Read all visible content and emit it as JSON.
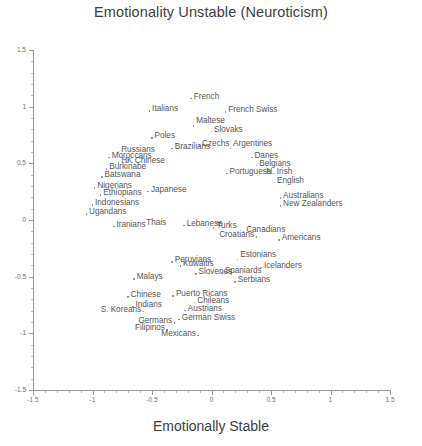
{
  "chart_data": {
    "type": "scatter",
    "title": "Emotionality Unstable (Neuroticism)",
    "xlabel": "Emotionally Stable",
    "ylabel": "",
    "xlim": [
      -1.5,
      1.5
    ],
    "ylim": [
      -1.5,
      1.5
    ],
    "xticks": [
      "-1.5",
      "-1",
      "-0.5",
      "0",
      "0.5",
      "1",
      "1.5"
    ],
    "xtick_values": [
      -1.5,
      -1,
      -0.5,
      0,
      0.5,
      1,
      1.5
    ],
    "yticks": [
      "1.5",
      "1",
      "0.5",
      "0",
      "-0.5",
      "-1",
      "-1.5"
    ],
    "ytick_values": [
      1.5,
      1,
      0.5,
      0,
      -0.5,
      -1,
      -1.5
    ],
    "grid": false,
    "legend": false,
    "points": [
      {
        "label": "French",
        "x": -0.17,
        "y": 1.07,
        "anchor": "right"
      },
      {
        "label": "Italians",
        "x": -0.52,
        "y": 0.96,
        "anchor": "right"
      },
      {
        "label": "French Swiss",
        "x": 0.12,
        "y": 0.95,
        "anchor": "right"
      },
      {
        "label": "Maltese",
        "x": -0.15,
        "y": 0.83,
        "anchor": "above"
      },
      {
        "label": "Slovaks",
        "x": 0.0,
        "y": 0.78,
        "anchor": "right"
      },
      {
        "label": "Poles",
        "x": -0.5,
        "y": 0.72,
        "anchor": "right"
      },
      {
        "label": "Czechs",
        "x": -0.1,
        "y": 0.65,
        "anchor": "right"
      },
      {
        "label": "Brazilians",
        "x": -0.33,
        "y": 0.63,
        "anchor": "right"
      },
      {
        "label": "Argentines",
        "x": 0.16,
        "y": 0.63,
        "anchor": "above"
      },
      {
        "label": "Russians",
        "x": -0.78,
        "y": 0.6,
        "anchor": "right"
      },
      {
        "label": "Danes",
        "x": 0.34,
        "y": 0.55,
        "anchor": "right"
      },
      {
        "label": "Moroccans",
        "x": -0.86,
        "y": 0.55,
        "anchor": "right"
      },
      {
        "label": "HK Chinese",
        "x": -0.78,
        "y": 0.5,
        "anchor": "right"
      },
      {
        "label": "Belgians",
        "x": 0.38,
        "y": 0.48,
        "anchor": "right"
      },
      {
        "label": "Burkinabe",
        "x": -0.88,
        "y": 0.45,
        "anchor": "right"
      },
      {
        "label": "Portuguese",
        "x": 0.13,
        "y": 0.41,
        "anchor": "right"
      },
      {
        "label": "N. Irish",
        "x": 0.44,
        "y": 0.41,
        "anchor": "right"
      },
      {
        "label": "Batswana",
        "x": -0.92,
        "y": 0.38,
        "anchor": "right"
      },
      {
        "label": "English",
        "x": 0.53,
        "y": 0.33,
        "anchor": "right"
      },
      {
        "label": "Nigerians",
        "x": -0.98,
        "y": 0.28,
        "anchor": "right"
      },
      {
        "label": "Japanese",
        "x": -0.53,
        "y": 0.25,
        "anchor": "right"
      },
      {
        "label": "Ethiopians",
        "x": -0.93,
        "y": 0.22,
        "anchor": "right"
      },
      {
        "label": "Australians",
        "x": 0.58,
        "y": 0.19,
        "anchor": "right"
      },
      {
        "label": "Indonesians",
        "x": -1.0,
        "y": 0.13,
        "anchor": "right"
      },
      {
        "label": "New Zealanders",
        "x": 0.58,
        "y": 0.12,
        "anchor": "right"
      },
      {
        "label": "Ugandans",
        "x": -1.05,
        "y": 0.05,
        "anchor": "right"
      },
      {
        "label": "Iranians",
        "x": -0.82,
        "y": -0.06,
        "anchor": "right"
      },
      {
        "label": "Thais",
        "x": -0.57,
        "y": -0.04,
        "anchor": "right"
      },
      {
        "label": "Lebanese",
        "x": -0.23,
        "y": -0.05,
        "anchor": "right"
      },
      {
        "label": "Turks",
        "x": 0.02,
        "y": -0.07,
        "anchor": "right"
      },
      {
        "label": "Canadians",
        "x": 0.27,
        "y": -0.11,
        "anchor": "right"
      },
      {
        "label": "Croatians",
        "x": 0.38,
        "y": -0.15,
        "anchor": "left"
      },
      {
        "label": "Americans",
        "x": 0.57,
        "y": -0.18,
        "anchor": "right"
      },
      {
        "label": "Peruvians",
        "x": -0.33,
        "y": -0.37,
        "anchor": "right"
      },
      {
        "label": "Estonians",
        "x": 0.22,
        "y": -0.35,
        "anchor": "above"
      },
      {
        "label": "Kuwaitis",
        "x": -0.26,
        "y": -0.41,
        "anchor": "right"
      },
      {
        "label": "Icelanders",
        "x": 0.42,
        "y": -0.42,
        "anchor": "right"
      },
      {
        "label": "Slovenes",
        "x": -0.13,
        "y": -0.48,
        "anchor": "right"
      },
      {
        "label": "Spaniards",
        "x": 0.09,
        "y": -0.47,
        "anchor": "right"
      },
      {
        "label": "Malays",
        "x": -0.65,
        "y": -0.52,
        "anchor": "right"
      },
      {
        "label": "Serbians",
        "x": 0.2,
        "y": -0.55,
        "anchor": "right"
      },
      {
        "label": "Chinese",
        "x": -0.7,
        "y": -0.68,
        "anchor": "right"
      },
      {
        "label": "Puerto Ricans",
        "x": -0.32,
        "y": -0.67,
        "anchor": "right"
      },
      {
        "label": "Indians",
        "x": -0.66,
        "y": -0.77,
        "anchor": "right"
      },
      {
        "label": "Chileans",
        "x": -0.14,
        "y": -0.73,
        "anchor": "right"
      },
      {
        "label": "S. Koreans",
        "x": -0.57,
        "y": -0.81,
        "anchor": "left"
      },
      {
        "label": "Austrians",
        "x": -0.22,
        "y": -0.8,
        "anchor": "right"
      },
      {
        "label": "German Swiss",
        "x": -0.27,
        "y": -0.88,
        "anchor": "right"
      },
      {
        "label": "Germans",
        "x": -0.31,
        "y": -0.91,
        "anchor": "left"
      },
      {
        "label": "Filipinos",
        "x": -0.37,
        "y": -0.97,
        "anchor": "left"
      },
      {
        "label": "Mexicans",
        "x": -0.11,
        "y": -1.02,
        "anchor": "left"
      }
    ]
  }
}
